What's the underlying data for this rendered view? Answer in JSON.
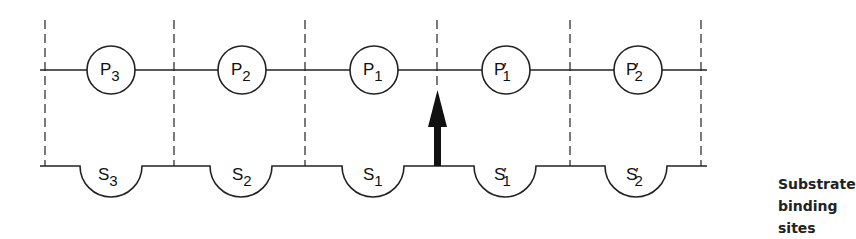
{
  "diagram": {
    "product_sites": [
      {
        "letter": "P",
        "prime": "",
        "sub": "3"
      },
      {
        "letter": "P",
        "prime": "",
        "sub": "2"
      },
      {
        "letter": "P",
        "prime": "",
        "sub": "1"
      },
      {
        "letter": "P",
        "prime": "′",
        "sub": "1"
      },
      {
        "letter": "P",
        "prime": "′",
        "sub": "2"
      }
    ],
    "substrate_sites": [
      {
        "letter": "S",
        "prime": "",
        "sub": "3"
      },
      {
        "letter": "S",
        "prime": "",
        "sub": "2"
      },
      {
        "letter": "S",
        "prime": "",
        "sub": "1"
      },
      {
        "letter": "S",
        "prime": "′",
        "sub": "1"
      },
      {
        "letter": "S",
        "prime": "′",
        "sub": "2"
      }
    ],
    "caption_line1": "Substrate",
    "caption_line2": "binding sites",
    "arrow_position": "between S1 and S′1"
  }
}
